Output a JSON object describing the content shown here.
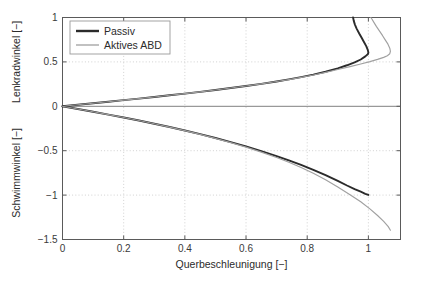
{
  "chart_data": {
    "type": "line",
    "title": "",
    "xlabel": "Querbeschleunigung [−]",
    "ylabel_top": "Lenkradwinkel [−]",
    "ylabel_bottom": "Schwimmwinkel [−]",
    "grid": true,
    "legend_position": "top-left",
    "xlim": [
      0,
      1.105
    ],
    "ylim": [
      -1.5,
      1.0
    ],
    "xticks": [
      0,
      0.2,
      0.4,
      0.6,
      0.8,
      1
    ],
    "xticklabels": [
      "0",
      "0.2",
      "0.4",
      "0.6",
      "0.8",
      "1"
    ],
    "yticks": [
      1,
      0.5,
      0,
      -0.5,
      -1,
      -1.5
    ],
    "yticklabels": [
      "1",
      "0.5",
      "0",
      "−0.5",
      "−1",
      "−1.5"
    ],
    "axis_split_value": 0,
    "colors": {
      "passiv": "#2b2b2b",
      "aktiv": "#a0a0a0",
      "grid": "#cccccc",
      "axis": "#5a5a5a",
      "background": "#ffffff"
    },
    "series": [
      {
        "name": "Passiv",
        "color": "#2b2b2b",
        "panel": "top",
        "x": [
          0.0,
          0.05,
          0.1,
          0.15,
          0.2,
          0.25,
          0.3,
          0.35,
          0.4,
          0.45,
          0.5,
          0.55,
          0.6,
          0.65,
          0.7,
          0.74,
          0.78,
          0.82,
          0.86,
          0.9,
          0.93,
          0.955,
          0.975,
          0.99,
          0.998,
          1.0,
          0.998,
          0.993,
          0.986,
          0.978,
          0.97,
          0.962,
          0.956,
          0.952,
          0.95
        ],
        "y": [
          0.0,
          0.017,
          0.034,
          0.051,
          0.069,
          0.087,
          0.105,
          0.124,
          0.143,
          0.163,
          0.184,
          0.206,
          0.229,
          0.253,
          0.28,
          0.303,
          0.329,
          0.357,
          0.389,
          0.427,
          0.462,
          0.495,
          0.527,
          0.562,
          0.585,
          0.605,
          0.635,
          0.678,
          0.722,
          0.772,
          0.82,
          0.872,
          0.92,
          0.965,
          1.0
        ]
      },
      {
        "name": "Aktives ABD",
        "color": "#a0a0a0",
        "panel": "top",
        "x": [
          0.0,
          0.05,
          0.1,
          0.15,
          0.2,
          0.25,
          0.3,
          0.35,
          0.4,
          0.45,
          0.5,
          0.55,
          0.6,
          0.65,
          0.7,
          0.74,
          0.78,
          0.82,
          0.86,
          0.9,
          0.94,
          0.975,
          1.005,
          1.03,
          1.05,
          1.062,
          1.07,
          1.072,
          1.07,
          1.064,
          1.055,
          1.046,
          1.036,
          1.026,
          1.018,
          1.012,
          1.008
        ],
        "y": [
          0.0,
          0.017,
          0.034,
          0.051,
          0.069,
          0.087,
          0.105,
          0.124,
          0.143,
          0.163,
          0.184,
          0.206,
          0.229,
          0.253,
          0.279,
          0.301,
          0.326,
          0.353,
          0.382,
          0.414,
          0.447,
          0.476,
          0.503,
          0.528,
          0.551,
          0.57,
          0.592,
          0.62,
          0.655,
          0.7,
          0.748,
          0.798,
          0.85,
          0.9,
          0.945,
          0.98,
          1.0
        ]
      },
      {
        "name": "Passiv",
        "color": "#2b2b2b",
        "panel": "bottom",
        "x": [
          0.0,
          0.05,
          0.1,
          0.15,
          0.2,
          0.25,
          0.3,
          0.35,
          0.4,
          0.45,
          0.5,
          0.55,
          0.6,
          0.65,
          0.7,
          0.74,
          0.78,
          0.82,
          0.86,
          0.9,
          0.93,
          0.955,
          0.975,
          0.99,
          1.0
        ],
        "y": [
          0.0,
          -0.03,
          -0.061,
          -0.093,
          -0.126,
          -0.16,
          -0.196,
          -0.233,
          -0.272,
          -0.313,
          -0.357,
          -0.403,
          -0.452,
          -0.504,
          -0.56,
          -0.608,
          -0.66,
          -0.715,
          -0.775,
          -0.84,
          -0.892,
          -0.933,
          -0.962,
          -0.985,
          -0.998
        ]
      },
      {
        "name": "Aktives ABD",
        "color": "#a0a0a0",
        "panel": "bottom",
        "x": [
          0.0,
          0.05,
          0.1,
          0.15,
          0.2,
          0.25,
          0.3,
          0.35,
          0.4,
          0.45,
          0.5,
          0.55,
          0.6,
          0.65,
          0.7,
          0.74,
          0.78,
          0.82,
          0.86,
          0.9,
          0.94,
          0.975,
          1.005,
          1.03,
          1.05,
          1.065,
          1.072
        ],
        "y": [
          0.0,
          -0.03,
          -0.061,
          -0.093,
          -0.126,
          -0.16,
          -0.196,
          -0.234,
          -0.274,
          -0.316,
          -0.361,
          -0.409,
          -0.46,
          -0.516,
          -0.577,
          -0.63,
          -0.69,
          -0.755,
          -0.828,
          -0.908,
          -0.995,
          -1.075,
          -1.155,
          -1.23,
          -1.295,
          -1.355,
          -1.395
        ]
      }
    ],
    "legend": [
      {
        "label": "Passiv",
        "color": "#2b2b2b",
        "width": 2.4
      },
      {
        "label": "Aktives ABD",
        "color": "#a0a0a0",
        "width": 1.3
      }
    ]
  }
}
